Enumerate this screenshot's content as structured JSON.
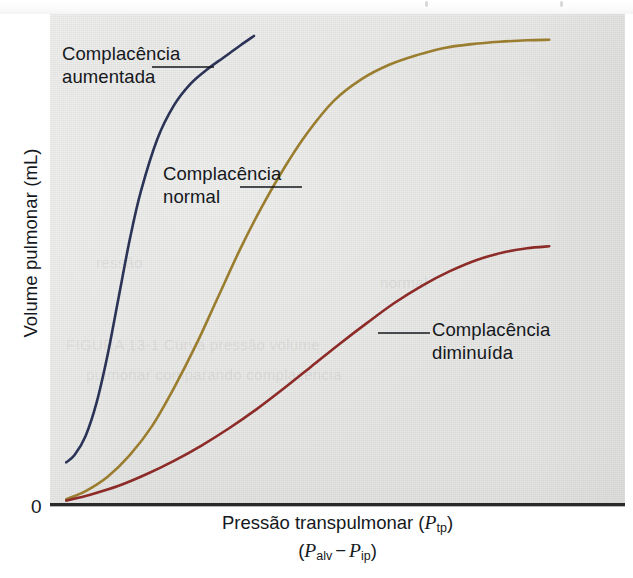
{
  "figure": {
    "background_color": "#ffffff",
    "panel_color": "#d8d8d6"
  },
  "axes": {
    "y_title": "Volume pulmonar (mL)",
    "origin_label": "0",
    "x_title_line1_prefix": "Pressão transpulmonar (",
    "x_title_line1_symbol": "P",
    "x_title_line1_sub": "tp",
    "x_title_line1_suffix": ")",
    "x_title_line2_open": "(",
    "x_title_line2_symbol_a": "P",
    "x_title_line2_sub_a": "alv",
    "x_title_line2_minus": "−",
    "x_title_line2_symbol_b": "P",
    "x_title_line2_sub_b": "ip",
    "x_title_line2_close": ")",
    "axis_color": "#2a2a2a"
  },
  "annotations": [
    {
      "id": "aumentada",
      "line1": "Complacência",
      "line2": "aumentada",
      "color": "#15181c"
    },
    {
      "id": "normal",
      "line1": "Complacência",
      "line2": "normal",
      "color": "#15181c"
    },
    {
      "id": "diminuida",
      "line1": "Complacência",
      "line2": "diminuída",
      "color": "#15181c"
    }
  ],
  "chart_data": {
    "type": "line",
    "title": "",
    "subtitle": "",
    "xlabel": "Pressão transpulmonar (Ptp)  (Palv − Pip)",
    "ylabel": "Volume pulmonar (mL)",
    "xlim": [
      0,
      100
    ],
    "ylim": [
      0,
      100
    ],
    "grid": false,
    "legend_position": "inline-annotations",
    "x_tick_labels": [],
    "y_tick_labels": [
      "0"
    ],
    "series": [
      {
        "name": "Complacência aumentada",
        "label_pt": "Complacência aumentada",
        "color": "#2b3356",
        "description": "Steep, left-shifted sigmoid — increased compliance (e.g. emphysema). Curve is drawn only up to mid-height where it exits the top of the panel.",
        "x": [
          1.5,
          3,
          5,
          7,
          9,
          11,
          13,
          15,
          18,
          21,
          24,
          27,
          30,
          33,
          35.5
        ],
        "y": [
          8.5,
          10,
          14,
          21,
          31,
          43,
          55,
          65,
          76,
          83,
          87.5,
          90.5,
          93,
          95.5,
          97.5
        ]
      },
      {
        "name": "Complacência normal",
        "label_pt": "Complacência normal",
        "color": "#9a7d2e",
        "description": "Normal sigmoid pressure-volume curve, plateauing near the top right of the panel.",
        "x": [
          1.5,
          5,
          9,
          13,
          17,
          21,
          25,
          29,
          33,
          37,
          41,
          45,
          50,
          55,
          60,
          65,
          70,
          75,
          80,
          85,
          89
        ],
        "y": [
          0.8,
          2.5,
          5.5,
          10,
          16,
          24,
          33,
          43,
          53,
          62,
          70,
          77,
          84,
          88.5,
          91.5,
          93.5,
          95,
          95.8,
          96.3,
          96.6,
          96.7
        ]
      },
      {
        "name": "Complacência diminuída",
        "label_pt": "Complacência diminuída",
        "color": "#8c2b28",
        "description": "Flattened, right-shifted sigmoid — decreased compliance (e.g. fibrosis). Reaches only about half the normal maximum volume.",
        "x": [
          1.5,
          6,
          11,
          16,
          21,
          26,
          31,
          36,
          41,
          46,
          51,
          56,
          61,
          66,
          71,
          76,
          81,
          85,
          89
        ],
        "y": [
          0.5,
          1.8,
          3.6,
          6.0,
          8.8,
          12.0,
          15.6,
          19.6,
          24.0,
          28.6,
          33.2,
          37.6,
          41.8,
          45.4,
          48.4,
          50.8,
          52.4,
          53.2,
          53.6
        ]
      }
    ]
  },
  "leader_lines": [
    {
      "name": "leader-aumentada",
      "x1": 152,
      "y1": 67,
      "x2": 214,
      "y2": 67,
      "color": "#15181c"
    },
    {
      "name": "leader-normal",
      "x1": 240,
      "y1": 187,
      "x2": 302,
      "y2": 187,
      "color": "#15181c"
    },
    {
      "name": "leader-diminuida",
      "x1": 378,
      "y1": 333,
      "x2": 430,
      "y2": 333,
      "color": "#15181c"
    }
  ]
}
